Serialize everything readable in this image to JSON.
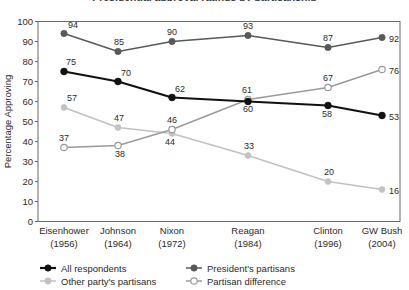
{
  "chart_data": {
    "type": "line",
    "title": "Presidential approval ratings by partisanship",
    "title_cropped": true,
    "xlabel": "",
    "ylabel": "Percentage Approving",
    "ylim": [
      0,
      100
    ],
    "ytick_step": 10,
    "yticks": [
      "100",
      "90",
      "80",
      "70",
      "60",
      "50",
      "40",
      "30",
      "20",
      "10",
      "0"
    ],
    "grid": false,
    "legend_position": "bottom",
    "categories": [
      "Eisenhower\n(1956)",
      "Johnson\n(1964)",
      "Nixon\n(1972)",
      "Reagan\n(1984)",
      "Clinton\n(1996)",
      "GW Bush\n(2004)"
    ],
    "category_names": [
      "Eisenhower",
      "Johnson",
      "Nixon",
      "Reagan",
      "Clinton",
      "GW Bush"
    ],
    "category_years": [
      "(1956)",
      "(1964)",
      "(1972)",
      "(1984)",
      "(1996)",
      "(2004)"
    ],
    "x": [
      1956,
      1964,
      1972,
      1984,
      1996,
      2004
    ],
    "series": [
      {
        "name": "All respondents",
        "values": [
          75,
          70,
          62,
          60,
          58,
          53
        ],
        "color": "#111111",
        "marker": "filled-circle",
        "line_width": 2.2,
        "marker_size": 3.4,
        "label_offsets": [
          {
            "dx": 2,
            "dy": -7,
            "anchor": "start"
          },
          {
            "dx": 3,
            "dy": -6,
            "anchor": "start"
          },
          {
            "dx": 3,
            "dy": -6,
            "anchor": "start"
          },
          {
            "dx": 0,
            "dy": 10,
            "anchor": "middle"
          },
          {
            "dx": -1,
            "dy": 11,
            "anchor": "middle"
          },
          {
            "dx": 7,
            "dy": 4,
            "anchor": "start"
          }
        ]
      },
      {
        "name": "President's partisans",
        "values": [
          94,
          85,
          90,
          93,
          87,
          92
        ],
        "color": "#595959",
        "marker": "filled-circle",
        "line_width": 1.5,
        "marker_size": 3.2,
        "label_offsets": [
          {
            "dx": 4,
            "dy": -6,
            "anchor": "start"
          },
          {
            "dx": 1,
            "dy": -7,
            "anchor": "middle"
          },
          {
            "dx": 0,
            "dy": -7,
            "anchor": "middle"
          },
          {
            "dx": 0,
            "dy": -7,
            "anchor": "middle"
          },
          {
            "dx": 0,
            "dy": -7,
            "anchor": "middle"
          },
          {
            "dx": 7,
            "dy": 4,
            "anchor": "start"
          }
        ]
      },
      {
        "name": "Other party's partisans",
        "values": [
          57,
          47,
          44,
          33,
          20,
          16
        ],
        "color": "#c2c2c2",
        "marker": "filled-circle",
        "line_width": 1.6,
        "marker_size": 3.0,
        "label_offsets": [
          {
            "dx": 3,
            "dy": -7,
            "anchor": "start"
          },
          {
            "dx": 1,
            "dy": -7,
            "anchor": "middle"
          },
          {
            "dx": -2,
            "dy": 11,
            "anchor": "middle"
          },
          {
            "dx": 1,
            "dy": -7,
            "anchor": "middle"
          },
          {
            "dx": 1,
            "dy": -7,
            "anchor": "middle"
          },
          {
            "dx": 7,
            "dy": 4,
            "anchor": "start"
          }
        ]
      },
      {
        "name": "Partisan difference",
        "values": [
          37,
          38,
          46,
          61,
          67,
          76
        ],
        "color": "#9a9a9a",
        "marker": "open-circle",
        "line_width": 1.4,
        "marker_size": 3.2,
        "label_offsets": [
          {
            "dx": 0,
            "dy": -7,
            "anchor": "middle"
          },
          {
            "dx": 2,
            "dy": 11,
            "anchor": "middle"
          },
          {
            "dx": 0,
            "dy": -7,
            "anchor": "middle"
          },
          {
            "dx": -1,
            "dy": -7,
            "anchor": "middle"
          },
          {
            "dx": 0,
            "dy": -7,
            "anchor": "middle"
          },
          {
            "dx": 7,
            "dy": 4,
            "anchor": "start"
          }
        ]
      }
    ],
    "legend": [
      {
        "label": "All respondents",
        "color": "#111111",
        "marker": "filled-circle"
      },
      {
        "label": "President's partisans",
        "color": "#595959",
        "marker": "filled-circle"
      },
      {
        "label": "Other party's partisans",
        "color": "#c2c2c2",
        "marker": "filled-circle"
      },
      {
        "label": "Partisan difference",
        "color": "#9a9a9a",
        "marker": "open-circle"
      }
    ]
  }
}
